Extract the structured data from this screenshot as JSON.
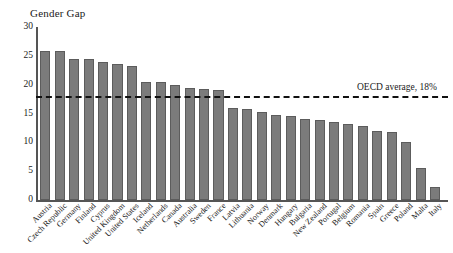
{
  "chart_data": {
    "type": "bar",
    "title": "Gender Gap",
    "xlabel": "",
    "ylabel": "",
    "ylim": [
      0,
      30
    ],
    "yticks": [
      30,
      25,
      20,
      15,
      10,
      5,
      0
    ],
    "grid": false,
    "legend": false,
    "bar_color": "#7b7b7b",
    "annotations": [
      {
        "name": "oecd-average",
        "text": "OECD average, 18%",
        "type": "hline",
        "value": 18,
        "style": "dashed"
      }
    ],
    "categories": [
      "Austria",
      "Czech Republic",
      "Germany",
      "Finland",
      "Cyprus",
      "United Kingdom",
      "United States",
      "Iceland",
      "Netherlands",
      "Canada",
      "Australia",
      "Sweden",
      "France",
      "Latvia",
      "Lithuania",
      "Norway",
      "Denmark",
      "Hungary",
      "Bulgaria",
      "New Zealand",
      "Portugal",
      "Belgium",
      "Romania",
      "Spain",
      "Greece",
      "Poland",
      "Malta",
      "Italy"
    ],
    "values": [
      25.8,
      25.8,
      24.4,
      24.4,
      23.9,
      23.5,
      23.3,
      20.5,
      20.4,
      20.0,
      19.4,
      19.2,
      19.1,
      16.0,
      15.7,
      15.2,
      14.8,
      14.5,
      14.0,
      13.9,
      13.6,
      13.2,
      12.8,
      11.9,
      11.8,
      10.0,
      5.5,
      2.3
    ]
  }
}
